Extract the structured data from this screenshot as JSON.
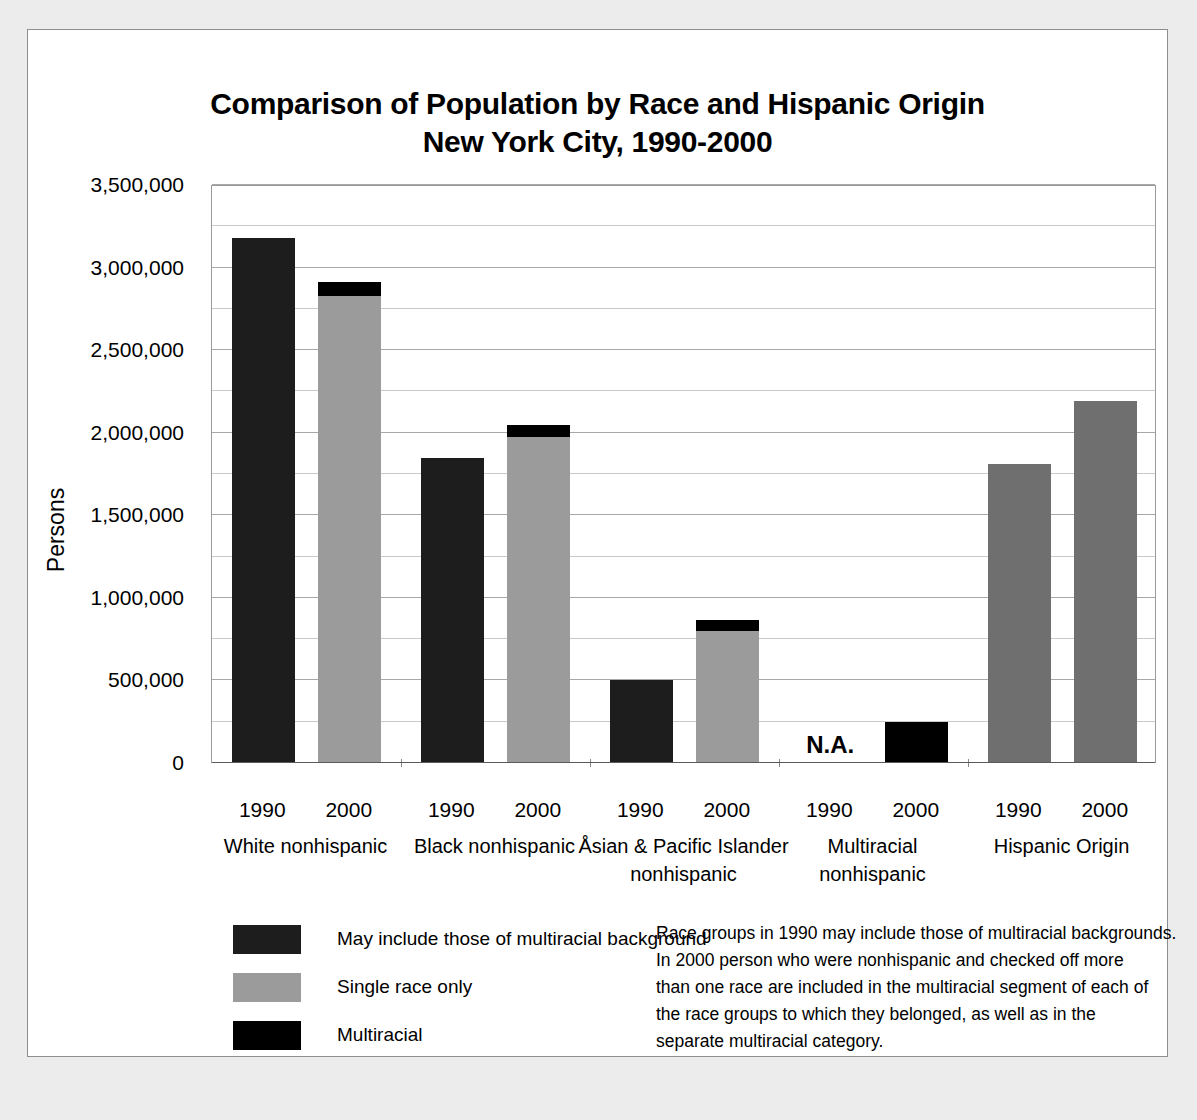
{
  "chart_data": {
    "type": "bar",
    "title": "Comparison of Population by Race and Hispanic Origin New York City, 1990-2000",
    "title_lines": [
      "Comparison of Population by Race and Hispanic Origin",
      "New York City, 1990-2000"
    ],
    "xlabel": "",
    "ylabel": "Persons",
    "ylim": [
      0,
      3500000
    ],
    "grid": true,
    "major_tick_step": 500000,
    "minor_tick_step": 250000,
    "ytick_labels": [
      "3,500,000",
      "3,000,000",
      "2,500,000",
      "2,000,000",
      "1,500,000",
      "1,000,000",
      "500,000",
      "0"
    ],
    "ytick_values": [
      3500000,
      3000000,
      2500000,
      2000000,
      1500000,
      1000000,
      500000,
      0
    ],
    "legend_position": "bottom-left",
    "series": [
      {
        "name": "May include those of multiracial background",
        "color": "#1d1d1d"
      },
      {
        "name": "Single race only",
        "color": "#9b9b9b"
      },
      {
        "name": "Multiracial",
        "color": "#000000"
      }
    ],
    "groups": [
      {
        "label": "White nonhispanic",
        "label_lines": [
          "White nonhispanic"
        ],
        "bars": [
          {
            "year": "1990",
            "total": 3180000,
            "single_race": null,
            "multiracial": null,
            "style": "dark"
          },
          {
            "year": "2000",
            "total": 2910000,
            "single_race": 2830000,
            "multiracial": 80000,
            "style": "stacked"
          }
        ]
      },
      {
        "label": "Black nonhispanic",
        "label_lines": [
          "Black nonhispanic"
        ],
        "bars": [
          {
            "year": "1990",
            "total": 1850000,
            "single_race": null,
            "multiracial": null,
            "style": "dark"
          },
          {
            "year": "2000",
            "total": 2045000,
            "single_race": 1975000,
            "multiracial": 70000,
            "style": "stacked"
          }
        ]
      },
      {
        "label": "Åsian & Pacific Islander nonhispanic",
        "label_lines": [
          "Åsian & Pacific Islander",
          "nonhispanic"
        ],
        "bars": [
          {
            "year": "1990",
            "total": 500000,
            "single_race": null,
            "multiracial": null,
            "style": "dark"
          },
          {
            "year": "2000",
            "total": 865000,
            "single_race": 800000,
            "multiracial": 65000,
            "style": "stacked"
          }
        ]
      },
      {
        "label": "Multiracial nonhispanic",
        "label_lines": [
          "Multiracial",
          "nonhispanic"
        ],
        "bars": [
          {
            "year": "1990",
            "total": null,
            "single_race": null,
            "multiracial": null,
            "style": "na",
            "note": "N.A."
          },
          {
            "year": "2000",
            "total": 250000,
            "single_race": null,
            "multiracial": 250000,
            "style": "multiracial"
          }
        ]
      },
      {
        "label": "Hispanic Origin",
        "label_lines": [
          "Hispanic Origin"
        ],
        "bars": [
          {
            "year": "1990",
            "total": 1810000,
            "single_race": null,
            "multiracial": null,
            "style": "hispanic"
          },
          {
            "year": "2000",
            "total": 2195000,
            "single_race": null,
            "multiracial": null,
            "style": "hispanic"
          }
        ]
      }
    ],
    "annotations": [
      {
        "text": "N.A.",
        "group": "Multiracial nonhispanic",
        "year": "1990"
      }
    ]
  },
  "legend": {
    "items": [
      {
        "label": "May include those of multiracial background",
        "swatch": "dark"
      },
      {
        "label": "Single race only",
        "swatch": "single"
      },
      {
        "label": "Multiracial",
        "swatch": "multi"
      }
    ]
  },
  "footnote": {
    "lines": [
      "Race groups in 1990 may include those of multiracial backgrounds.",
      "In 2000 person who were nonhispanic and checked off more",
      "than one race are included in the multiracial segment of each of",
      "the race groups to which they belonged, as well as in the",
      "separate multiracial category."
    ]
  },
  "colors": {
    "dark": "#1d1d1d",
    "single_race": "#9b9b9b",
    "multiracial": "#000000",
    "hispanic": "#6f6f6f",
    "page_background": "#ececed",
    "paper": "#ffffff"
  }
}
